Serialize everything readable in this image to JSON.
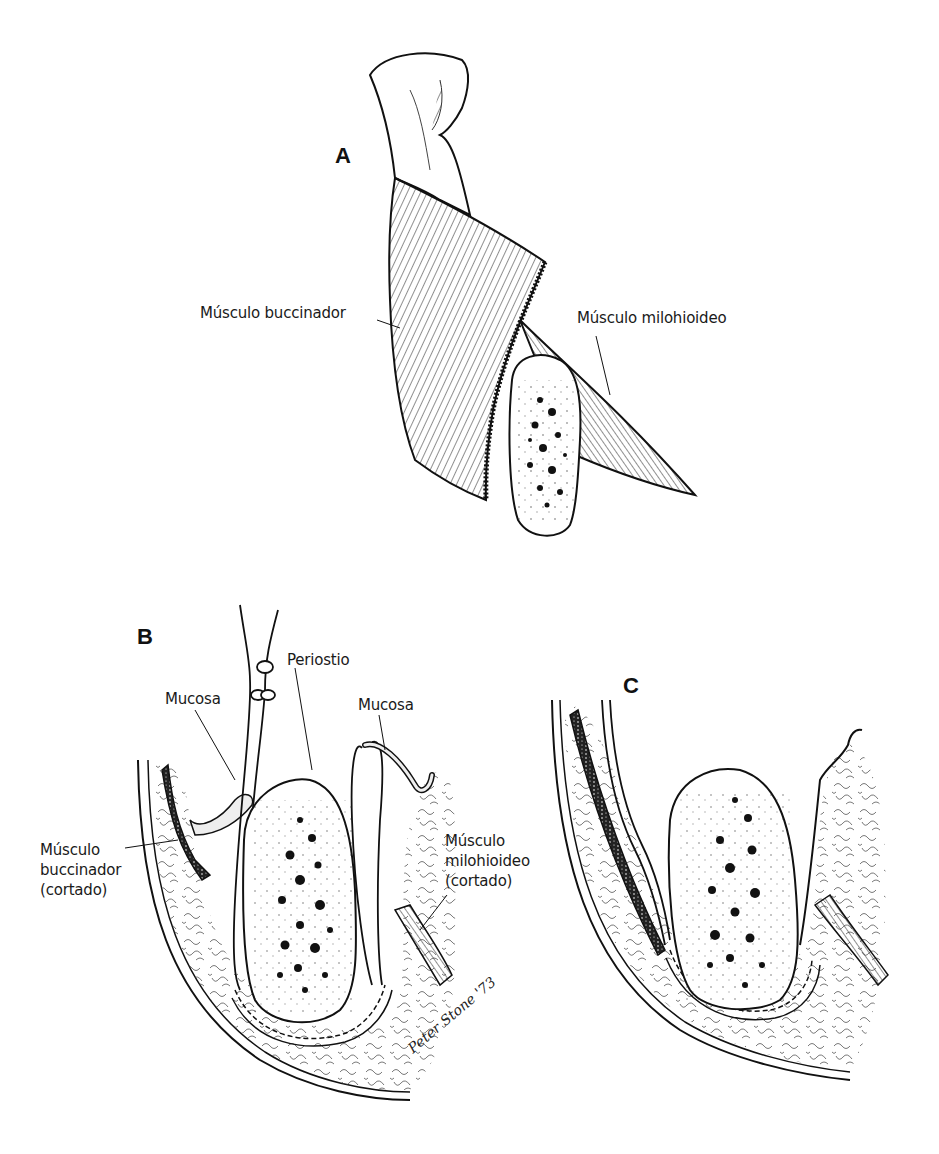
{
  "figure": {
    "panels": [
      {
        "id": "A",
        "label": "A",
        "labels": [
          "Músculo buccinador",
          "Músculo milohioideo"
        ]
      },
      {
        "id": "B",
        "label": "B",
        "labels": [
          "Periostio",
          "Mucosa",
          "Mucosa",
          "Músculo\nbuccinador\n(cortado)",
          "Músculo\nmilohioideo\n(cortado)"
        ]
      },
      {
        "id": "C",
        "label": "C",
        "labels": []
      }
    ],
    "signature": "Peter Stone '73"
  },
  "colors": {
    "ink": "#111111",
    "paper": "#ffffff",
    "tissue": "#f3f3f3"
  }
}
